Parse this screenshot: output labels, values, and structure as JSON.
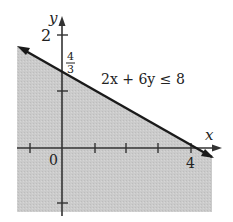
{
  "graph": {
    "inequality": "2x + 6y ≤ 8",
    "x_axis_label": "x",
    "y_axis_label": "y",
    "origin_label": "0",
    "x_tick_label": "4",
    "y_tick_label": "2",
    "y_intercept_num": "4",
    "y_intercept_den": "3",
    "colors": {
      "shade": "#c8c8c8",
      "line": "#1a1a1a",
      "axis": "#333333"
    }
  }
}
